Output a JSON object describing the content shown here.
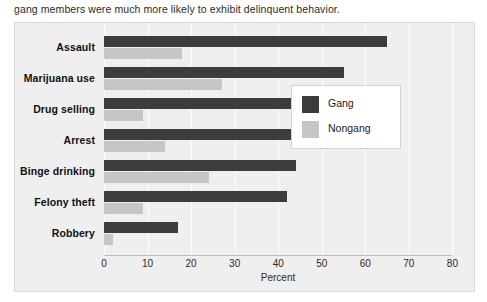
{
  "caption": "gang members were much more likely to exhibit delinquent behavior.",
  "legend": {
    "title": "",
    "entries": [
      {
        "label": "Gang",
        "color": "#3c3c3c"
      },
      {
        "label": "Nongang",
        "color": "#c6c6c6"
      }
    ]
  },
  "axis": {
    "xlabel": "Percent",
    "ticks": [
      "0",
      "10",
      "20",
      "30",
      "40",
      "50",
      "60",
      "70",
      "80"
    ]
  },
  "chart_data": {
    "type": "bar",
    "orientation": "horizontal",
    "title": "",
    "xlabel": "Percent",
    "ylabel": "",
    "xlim": [
      0,
      80
    ],
    "grid": true,
    "legend_position": "right",
    "categories": [
      "Assault",
      "Marijuana use",
      "Drug selling",
      "Arrest",
      "Binge drinking",
      "Felony theft",
      "Robbery"
    ],
    "series": [
      {
        "name": "Gang",
        "color": "#3c3c3c",
        "values": [
          65,
          55,
          52,
          52,
          44,
          42,
          17
        ]
      },
      {
        "name": "Nongang",
        "color": "#c6c6c6",
        "values": [
          18,
          27,
          9,
          14,
          24,
          9,
          2
        ]
      }
    ]
  }
}
